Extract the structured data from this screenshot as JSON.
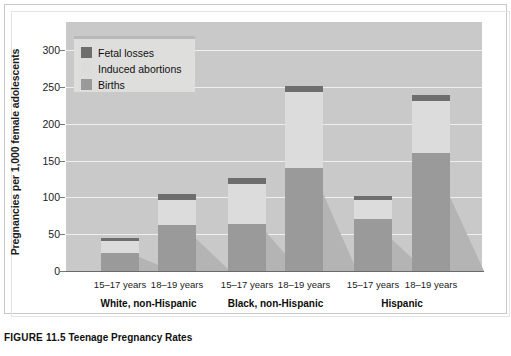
{
  "figure": {
    "caption_number": "FIGURE 11.5",
    "caption_title": "Teenage Pregnancy Rates"
  },
  "legend": {
    "items": [
      {
        "label": "Fetal losses",
        "color": "#6e6e6e",
        "key": "fetal"
      },
      {
        "label": "Induced abortions",
        "color": "#dcdcdc",
        "key": "abortions"
      },
      {
        "label": "Births",
        "color": "#9a9a9a",
        "key": "births"
      }
    ]
  },
  "axes": {
    "y_title": "Pregnancies per 1,000 female adolescents",
    "y_ticks": [
      0,
      50,
      100,
      150,
      200,
      250,
      300
    ],
    "y_min": 0,
    "y_max": 300
  },
  "chart_data": {
    "type": "bar",
    "title": "Teenage Pregnancy Rates",
    "subtitle": "",
    "xlabel": "",
    "ylabel": "Pregnancies per 1,000 female adolescents",
    "ylim": [
      0,
      300
    ],
    "grid": true,
    "stacked": true,
    "legend_position": "top-left",
    "categories": [
      "White, non-Hispanic 15–17 years",
      "White, non-Hispanic 18–19 years",
      "Black, non-Hispanic 15–17 years",
      "Black, non-Hispanic 18–19 years",
      "Hispanic 15–17 years",
      "Hispanic 18–19 years"
    ],
    "groups": [
      {
        "name": "White, non-Hispanic",
        "bars": [
          {
            "age": "15–17 years",
            "births": 24,
            "induced_abortions": 17,
            "fetal_losses": 4,
            "total": 45
          },
          {
            "age": "18–19 years",
            "births": 63,
            "induced_abortions": 34,
            "fetal_losses": 8,
            "total": 105
          }
        ]
      },
      {
        "name": "Black, non-Hispanic",
        "bars": [
          {
            "age": "15–17 years",
            "births": 64,
            "induced_abortions": 54,
            "fetal_losses": 8,
            "total": 126
          },
          {
            "age": "18–19 years",
            "births": 140,
            "induced_abortions": 103,
            "fetal_losses": 8,
            "total": 251
          }
        ]
      },
      {
        "name": "Hispanic",
        "bars": [
          {
            "age": "15–17 years",
            "births": 71,
            "induced_abortions": 25,
            "fetal_losses": 6,
            "total": 102
          },
          {
            "age": "18–19 years",
            "births": 160,
            "induced_abortions": 71,
            "fetal_losses": 8,
            "total": 239
          }
        ]
      }
    ],
    "series": [
      {
        "name": "Births",
        "values": [
          24,
          63,
          64,
          140,
          71,
          160
        ]
      },
      {
        "name": "Induced abortions",
        "values": [
          17,
          34,
          54,
          103,
          25,
          71
        ]
      },
      {
        "name": "Fetal losses",
        "values": [
          4,
          8,
          8,
          8,
          6,
          8
        ]
      }
    ]
  },
  "colors": {
    "plot_background": "#c9c9c9",
    "gridline": "#efefef",
    "births": "#9a9a9a",
    "induced_abortions": "#dcdcdc",
    "fetal_losses": "#6e6e6e",
    "bar_shadow": "#b4b4b4",
    "legend_background": "#dededc",
    "axis": "#6a6a6a"
  }
}
